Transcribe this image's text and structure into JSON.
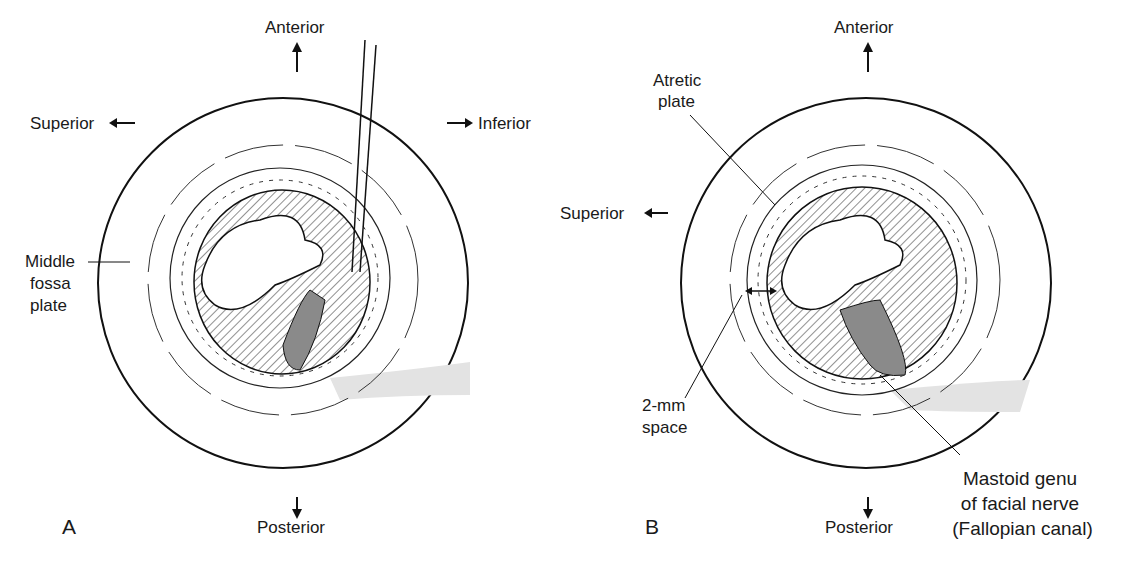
{
  "panels": [
    {
      "letter": "A",
      "labels": {
        "anterior": "Anterior",
        "posterior": "Posterior",
        "superior": "Superior",
        "inferior": "Inferior",
        "middle_fossa_1": "Middle",
        "middle_fossa_2": "fossa",
        "middle_fossa_3": "plate"
      }
    },
    {
      "letter": "B",
      "labels": {
        "anterior": "Anterior",
        "posterior": "Posterior",
        "superior": "Superior",
        "atretic_1": "Atretic",
        "atretic_2": "plate",
        "space_1": "2-mm",
        "space_2": "space",
        "mastoid_1": "Mastoid genu",
        "mastoid_2": "of facial nerve",
        "mastoid_3": "(Fallopian canal)"
      }
    }
  ],
  "colors": {
    "line": "#111111",
    "nerve": "#8a8a8a",
    "band": "#e3e3e3"
  }
}
